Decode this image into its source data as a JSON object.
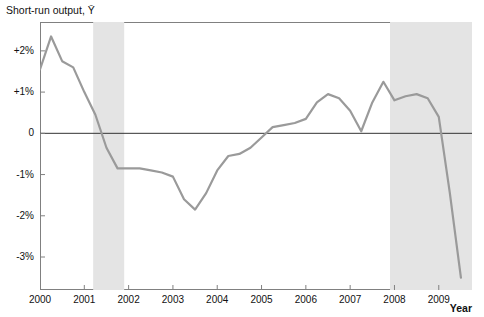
{
  "chart_data": {
    "type": "line",
    "title": "",
    "ylabel": "Short-run output, Ȳ",
    "xlabel": "Year",
    "grid": false,
    "legend": "none",
    "line_color": "#9a9a9a",
    "zero_line_color": "#333333",
    "shade_color": "#e4e4e4",
    "xlim": [
      2000.0,
      2009.75
    ],
    "ylim": [
      -3.8,
      2.7
    ],
    "xticks": [
      "2000",
      "2001",
      "2002",
      "2003",
      "2004",
      "2005",
      "2006",
      "2007",
      "2008",
      "2009"
    ],
    "yticks": [
      "+2%",
      "+1%",
      "0",
      "-1%",
      "-2%",
      "-3%"
    ],
    "ytick_values": [
      2,
      1,
      0,
      -1,
      -2,
      -3
    ],
    "recession_bands": [
      {
        "start": 2001.2,
        "end": 2001.9
      },
      {
        "start": 2007.9,
        "end": 2009.75
      }
    ],
    "x": [
      2000.0,
      2000.25,
      2000.5,
      2000.75,
      2001.0,
      2001.25,
      2001.5,
      2001.75,
      2002.0,
      2002.25,
      2002.5,
      2002.75,
      2003.0,
      2003.25,
      2003.5,
      2003.75,
      2004.0,
      2004.25,
      2004.5,
      2004.75,
      2005.0,
      2005.25,
      2005.5,
      2005.75,
      2006.0,
      2006.25,
      2006.5,
      2006.75,
      2007.0,
      2007.25,
      2007.5,
      2007.75,
      2008.0,
      2008.25,
      2008.5,
      2008.75,
      2009.0,
      2009.25,
      2009.5
    ],
    "y": [
      1.55,
      2.35,
      1.75,
      1.6,
      1.0,
      0.45,
      -0.35,
      -0.85,
      -0.85,
      -0.85,
      -0.9,
      -0.95,
      -1.05,
      -1.6,
      -1.85,
      -1.45,
      -0.9,
      -0.55,
      -0.5,
      -0.35,
      -0.1,
      0.15,
      0.2,
      0.25,
      0.35,
      0.75,
      0.95,
      0.85,
      0.55,
      0.05,
      0.75,
      1.25,
      0.8,
      0.9,
      0.95,
      0.85,
      0.4,
      -1.45,
      -3.5
    ]
  }
}
